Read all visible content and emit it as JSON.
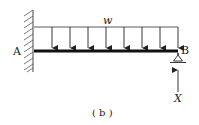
{
  "diagram": {
    "type": "cantilever-beam-with-prop",
    "labels": {
      "end_a": "A",
      "end_b": "B",
      "load": "w",
      "reaction": "X",
      "caption": "( b )"
    },
    "load_arrows_count": 8,
    "colors": {
      "stroke": "#222222",
      "hatch": "#444444"
    }
  }
}
